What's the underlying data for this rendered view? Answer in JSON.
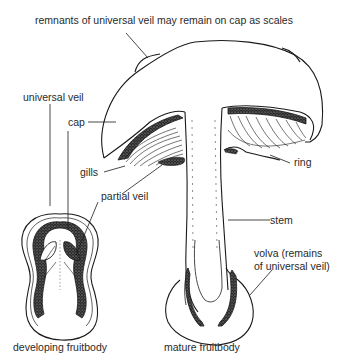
{
  "diagram": {
    "labels": {
      "scales": "remnants of universal veil may remain on cap as scales",
      "universal_veil": "universal veil",
      "cap": "cap",
      "gills": "gills",
      "partial_veil": "partial veil",
      "ring": "ring",
      "stem": "stem",
      "volva_line1": "volva (remains",
      "volva_line2": "of universal veil)",
      "developing": "developing fruitbody",
      "mature": "mature fruitbody"
    },
    "colors": {
      "ink": "#1a1a1a",
      "background": "#ffffff",
      "text": "#2a2a2a"
    }
  }
}
